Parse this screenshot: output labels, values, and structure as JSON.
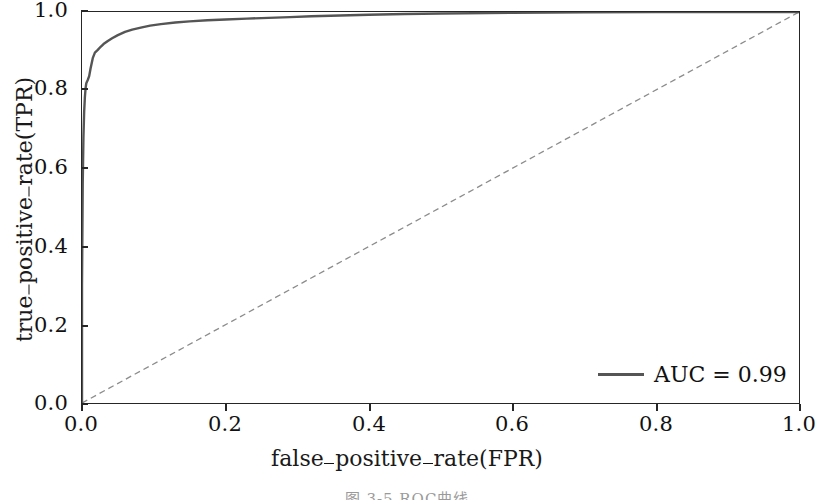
{
  "chart_data": {
    "type": "line",
    "title": "",
    "subtitle": "",
    "xlabel": "false_positive_rate(FPR)",
    "ylabel": "true_positive_rate(TPR)",
    "xlim": [
      0.0,
      1.0
    ],
    "ylim": [
      0.0,
      1.0
    ],
    "grid": false,
    "legend_position": "lower right",
    "annotations": [],
    "xticks": [
      "0.0",
      "0.2",
      "0.4",
      "0.6",
      "0.8",
      "1.0"
    ],
    "xtick_values": [
      0.0,
      0.2,
      0.4,
      0.6,
      0.8,
      1.0
    ],
    "yticks": [
      "0.0",
      "0.2",
      "0.4",
      "0.6",
      "0.8",
      "1.0"
    ],
    "ytick_values": [
      0.0,
      0.2,
      0.4,
      0.6,
      0.8,
      1.0
    ],
    "series": [
      {
        "name": "AUC = 0.99",
        "kind": "roc-curve",
        "color": "#555555",
        "linestyle": "solid",
        "linewidth": 2.4,
        "auc": 0.99,
        "x": [
          0.0,
          0.0,
          0.001,
          0.002,
          0.003,
          0.004,
          0.005,
          0.006,
          0.008,
          0.01,
          0.012,
          0.015,
          0.018,
          0.022,
          0.026,
          0.03,
          0.036,
          0.042,
          0.05,
          0.06,
          0.07,
          0.082,
          0.095,
          0.11,
          0.13,
          0.15,
          0.175,
          0.2,
          0.23,
          0.26,
          0.29,
          0.32,
          0.36,
          0.4,
          0.45,
          0.5,
          0.6,
          0.7,
          0.8,
          0.9,
          1.0
        ],
        "y": [
          0.0,
          0.3,
          0.56,
          0.68,
          0.745,
          0.782,
          0.805,
          0.818,
          0.826,
          0.836,
          0.856,
          0.882,
          0.896,
          0.903,
          0.911,
          0.918,
          0.926,
          0.933,
          0.941,
          0.949,
          0.955,
          0.96,
          0.965,
          0.969,
          0.973,
          0.976,
          0.979,
          0.981,
          0.983,
          0.985,
          0.987,
          0.989,
          0.991,
          0.993,
          0.995,
          0.996,
          0.998,
          0.999,
          1.0,
          1.0,
          1.0
        ]
      },
      {
        "name": "chance-diagonal",
        "kind": "reference-line",
        "color": "#8c8c8c",
        "linestyle": "dashed",
        "linewidth": 1.3,
        "x": [
          0.0,
          1.0
        ],
        "y": [
          0.0,
          1.0
        ]
      }
    ]
  },
  "legend": {
    "auc_label": "AUC = 0.99"
  },
  "axes": {
    "xlabel_parts": [
      "false",
      "positive",
      "rate(FPR)"
    ],
    "ylabel_parts": [
      "true",
      "positive",
      "rate(TPR)"
    ]
  },
  "caption": {
    "text": "图 3-5  ROC曲线"
  },
  "colors": {
    "curve": "#555555",
    "diagonal": "#8c8c8c",
    "axis": "#262626",
    "text": "#111111",
    "background": "#ffffff"
  }
}
